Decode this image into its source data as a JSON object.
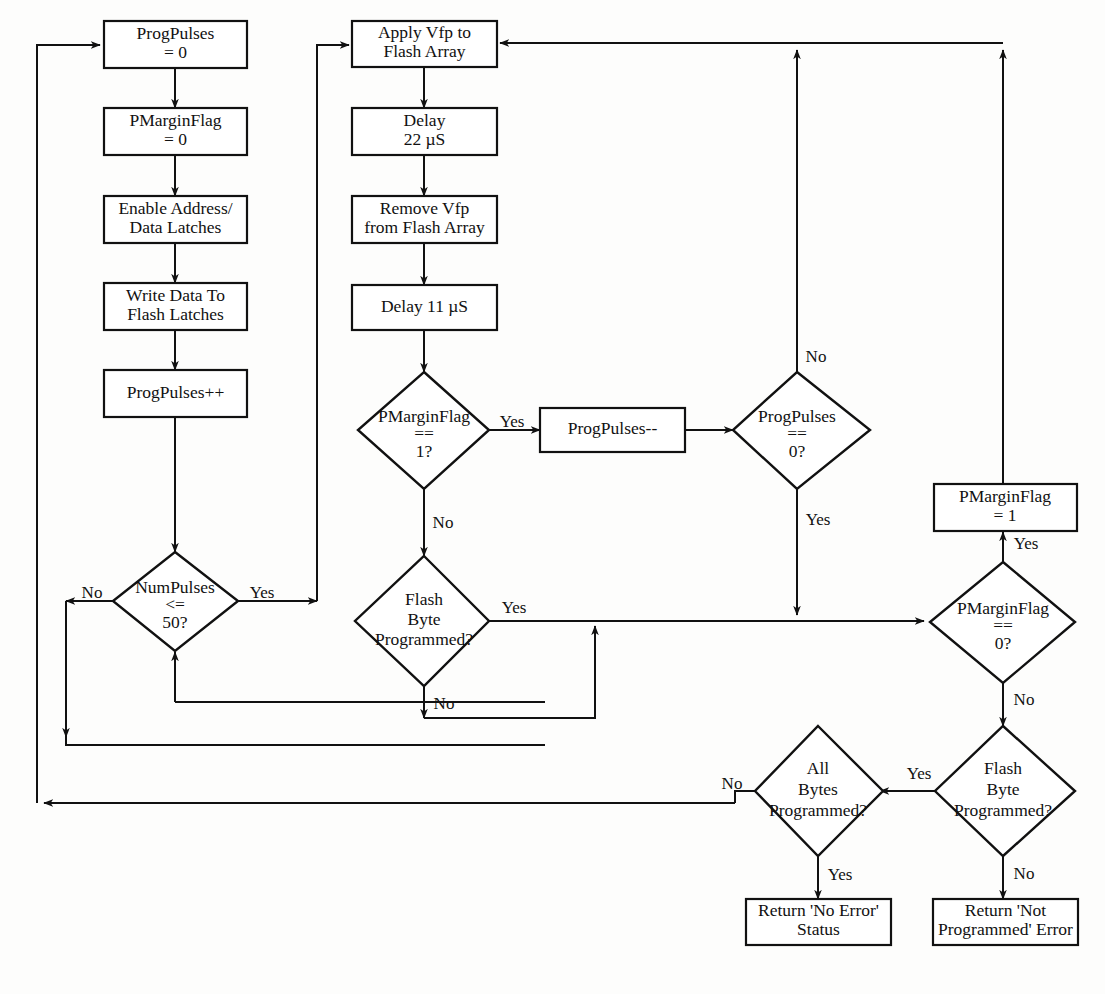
{
  "diagram": {
    "type": "flowchart",
    "background_color": "#fdfdfc",
    "line_color": "#111111",
    "node_fill": "#ffffff"
  },
  "nodes": {
    "prog_pulses_zero": {
      "shape": "process",
      "line1": "ProgPulses",
      "line2": "= 0"
    },
    "pmargin_zero": {
      "shape": "process",
      "line1": "PMarginFlag",
      "line2": "= 0"
    },
    "enable_latches": {
      "shape": "process",
      "line1": "Enable Address/",
      "line2": "Data Latches"
    },
    "write_data": {
      "shape": "process",
      "line1": "Write Data To",
      "line2": "Flash Latches"
    },
    "prog_pulses_inc": {
      "shape": "process",
      "line1": "ProgPulses++",
      "line2": ""
    },
    "num_pulses_dec": {
      "shape": "decision",
      "line1": "NumPulses",
      "line2": "<=",
      "line3": "50?"
    },
    "apply_vfp": {
      "shape": "process",
      "line1": "Apply Vfp to",
      "line2": "Flash Array"
    },
    "delay_22": {
      "shape": "process",
      "line1": "Delay",
      "line2": "22 µS"
    },
    "remove_vfp": {
      "shape": "process",
      "line1": "Remove Vfp",
      "line2": "from Flash Array"
    },
    "delay_11": {
      "shape": "process",
      "line1": "Delay 11 µS",
      "line2": ""
    },
    "pmargin_is_one": {
      "shape": "decision",
      "line1": "PMarginFlag",
      "line2": "==",
      "line3": "1?"
    },
    "flash_byte_mid": {
      "shape": "decision",
      "line1": "Flash",
      "line2": "Byte",
      "line3": "Programmed?"
    },
    "prog_pulses_dec": {
      "shape": "process",
      "line1": "ProgPulses--",
      "line2": ""
    },
    "prog_pulses_is_zero": {
      "shape": "decision",
      "line1": "ProgPulses",
      "line2": "==",
      "line3": "0?"
    },
    "pmargin_set_one": {
      "shape": "process",
      "line1": "PMarginFlag",
      "line2": "= 1"
    },
    "pmargin_is_zero": {
      "shape": "decision",
      "line1": "PMarginFlag",
      "line2": "==",
      "line3": "0?"
    },
    "flash_byte_right": {
      "shape": "decision",
      "line1": "Flash",
      "line2": "Byte",
      "line3": "Programmed?"
    },
    "all_bytes": {
      "shape": "decision",
      "line1": "All",
      "line2": "Bytes",
      "line3": "Programmed?"
    },
    "return_no_error": {
      "shape": "process",
      "line1": "Return 'No Error'",
      "line2": "Status"
    },
    "return_not_prog": {
      "shape": "process",
      "line1": "Return 'Not",
      "line2": "Programmed' Error"
    }
  },
  "edge_labels": {
    "num_pulses_no": "No",
    "num_pulses_yes": "Yes",
    "pmargin_is_one_yes": "Yes",
    "pmargin_is_one_no": "No",
    "flash_byte_mid_yes": "Yes",
    "flash_byte_mid_no": "No",
    "prog_pulses_zero_no": "No",
    "prog_pulses_zero_yes": "Yes",
    "pmargin_is_zero_yes": "Yes",
    "pmargin_is_zero_no": "No",
    "flash_byte_right_yes": "Yes",
    "flash_byte_right_no": "No",
    "all_bytes_no": "No",
    "all_bytes_yes": "Yes"
  }
}
